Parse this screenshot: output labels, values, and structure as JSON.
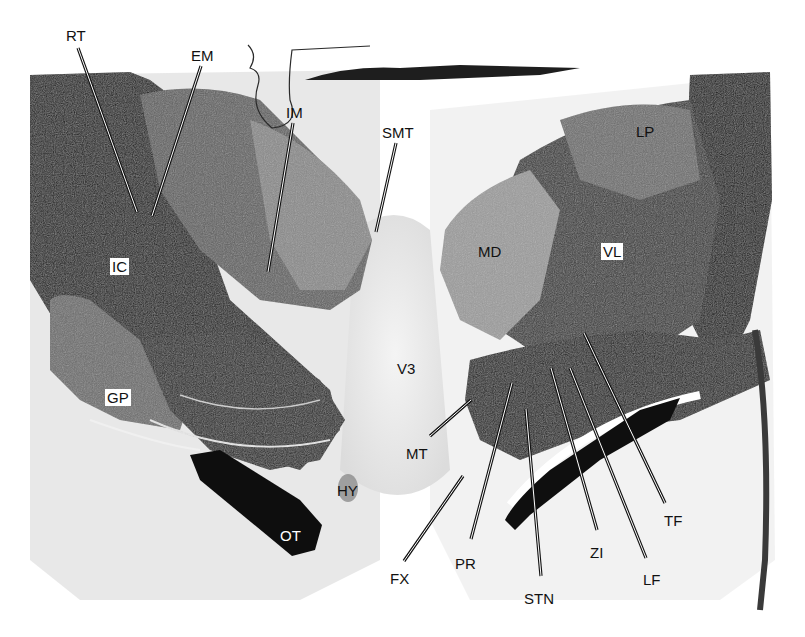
{
  "figure": {
    "type": "histology-section",
    "colors": {
      "background": "#ffffff",
      "tissue_dark": "#151515",
      "tissue_mid": "#5a5a5a",
      "tissue_light": "#9a9a9a",
      "label_text": "#111111"
    },
    "labels": [
      {
        "id": "RT",
        "text": "RT",
        "x": 66,
        "y": 28,
        "style": "plain",
        "line": [
          [
            78,
            48
          ],
          [
            137,
            212
          ]
        ]
      },
      {
        "id": "EM",
        "text": "EM",
        "x": 191,
        "y": 48,
        "style": "plain",
        "line": [
          [
            201,
            66
          ],
          [
            152,
            216
          ]
        ]
      },
      {
        "id": "IM",
        "text": "IM",
        "x": 286,
        "y": 105,
        "style": "plain",
        "line": [
          [
            293,
            123
          ],
          [
            268,
            272
          ]
        ]
      },
      {
        "id": "SMT",
        "text": "SMT",
        "x": 382,
        "y": 125,
        "style": "plain",
        "line": [
          [
            396,
            143
          ],
          [
            376,
            232
          ]
        ]
      },
      {
        "id": "LP",
        "text": "LP",
        "x": 636,
        "y": 124,
        "style": "plain",
        "line": null
      },
      {
        "id": "MD",
        "text": "MD",
        "x": 478,
        "y": 244,
        "style": "plain",
        "line": null
      },
      {
        "id": "VL",
        "text": "VL",
        "x": 601,
        "y": 243,
        "style": "boxed",
        "line": null
      },
      {
        "id": "IC",
        "text": "IC",
        "x": 110,
        "y": 258,
        "style": "boxed",
        "line": null
      },
      {
        "id": "V3",
        "text": "V3",
        "x": 397,
        "y": 361,
        "style": "plain",
        "line": null
      },
      {
        "id": "GP",
        "text": "GP",
        "x": 105,
        "y": 389,
        "style": "boxed",
        "line": null
      },
      {
        "id": "MT",
        "text": "MT",
        "x": 406,
        "y": 446,
        "style": "plain",
        "line": [
          [
            430,
            436
          ],
          [
            471,
            400
          ]
        ]
      },
      {
        "id": "HY",
        "text": "HY",
        "x": 337,
        "y": 483,
        "style": "plain",
        "line": null
      },
      {
        "id": "OT",
        "text": "OT",
        "x": 280,
        "y": 528,
        "style": "inverse",
        "line": null
      },
      {
        "id": "FX",
        "text": "FX",
        "x": 390,
        "y": 571,
        "style": "plain",
        "line": [
          [
            404,
            561
          ],
          [
            463,
            476
          ]
        ]
      },
      {
        "id": "PR",
        "text": "PR",
        "x": 455,
        "y": 556,
        "style": "plain",
        "line": [
          [
            471,
            539
          ],
          [
            512,
            383
          ]
        ]
      },
      {
        "id": "STN",
        "text": "STN",
        "x": 524,
        "y": 591,
        "style": "plain",
        "line": [
          [
            541,
            576
          ],
          [
            526,
            409
          ]
        ]
      },
      {
        "id": "ZI",
        "text": "ZI",
        "x": 590,
        "y": 545,
        "style": "plain",
        "line": [
          [
            597,
            530
          ],
          [
            551,
            368
          ]
        ]
      },
      {
        "id": "LF",
        "text": "LF",
        "x": 643,
        "y": 572,
        "style": "plain",
        "line": [
          [
            646,
            558
          ],
          [
            570,
            368
          ]
        ]
      },
      {
        "id": "TF",
        "text": "TF",
        "x": 664,
        "y": 513,
        "style": "plain",
        "line": [
          [
            665,
            503
          ],
          [
            584,
            333
          ]
        ]
      }
    ]
  }
}
